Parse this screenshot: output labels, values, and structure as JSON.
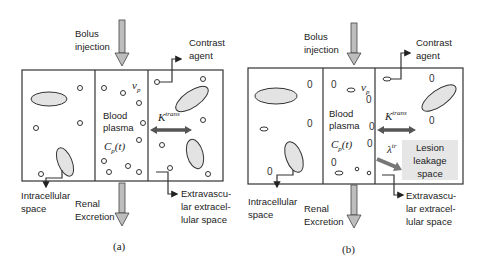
{
  "figure": {
    "panels": [
      {
        "caption": "(a)",
        "labels": {
          "bolus": [
            "Bolus",
            "injection"
          ],
          "contrast": [
            "Contrast",
            "agent"
          ],
          "vp": "v",
          "vp_sub": "p",
          "blood": [
            "Blood",
            "plasma"
          ],
          "cp": "C",
          "cp_sub": "p",
          "cp_arg": "(t)",
          "ktrans": "K",
          "ktrans_sup": "trans",
          "intracellular": [
            "Intracellular",
            "space"
          ],
          "renal": [
            "Renal",
            "Excretion"
          ],
          "ees": [
            "Extravascu-",
            "lar extracel-",
            "lular space"
          ]
        }
      },
      {
        "caption": "(b)",
        "labels": {
          "bolus": [
            "Bolus",
            "injection"
          ],
          "contrast": [
            "Contrast",
            "agent"
          ],
          "vp": "v",
          "vp_sub": "p",
          "blood": [
            "Blood",
            "plasma"
          ],
          "cp": "C",
          "cp_sub": "p",
          "cp_arg": "(t)",
          "ktrans": "K",
          "ktrans_sup": "trans",
          "lambda": "λ",
          "lambda_sup": "tr",
          "lesion": [
            "Lesion",
            "leakage",
            "space"
          ],
          "intracellular": [
            "Intracellular",
            "space"
          ],
          "renal": [
            "Renal",
            "Excretion"
          ],
          "ees": [
            "Extravascu-",
            "lar extracel-",
            "lular space"
          ]
        }
      }
    ],
    "colors": {
      "stroke": "#333333",
      "cell_fill": "#e3e3e3",
      "arrow_fill": "#bdbdbd",
      "lesion_bg": "#e6e6e6",
      "zero_glyph": "0"
    }
  }
}
